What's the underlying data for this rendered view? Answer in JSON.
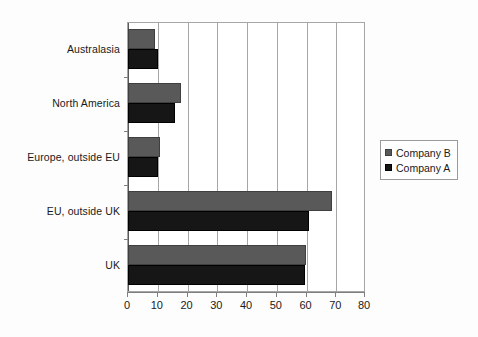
{
  "chart_data": {
    "type": "bar",
    "orientation": "horizontal",
    "title": "",
    "xlabel": "",
    "ylabel": "",
    "xlim": [
      0,
      80
    ],
    "xticks": [
      0,
      10,
      20,
      30,
      40,
      50,
      60,
      70,
      80
    ],
    "grid": "vertical",
    "legend_position": "right",
    "categories": [
      "Australasia",
      "North America",
      "Europe, outside EU",
      "EU, outside UK",
      "UK"
    ],
    "series": [
      {
        "name": "Company B",
        "color": "#595959",
        "values": [
          9,
          18,
          11,
          69,
          60.5
        ]
      },
      {
        "name": "Company A",
        "color": "#161616",
        "values": [
          10,
          16,
          10,
          61.5,
          60
        ]
      }
    ]
  },
  "legend": {
    "items": [
      {
        "label": "Company B",
        "swatch": "#595959"
      },
      {
        "label": "Company A",
        "swatch": "#161616"
      }
    ]
  },
  "axis": {
    "x_tick_labels": [
      "0",
      "10",
      "20",
      "30",
      "40",
      "50",
      "60",
      "70",
      "80"
    ]
  }
}
